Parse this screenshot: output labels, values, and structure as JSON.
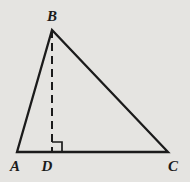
{
  "figure": {
    "background_color": "#e5e4e1",
    "line_color": "#1b1b1b",
    "points": {
      "A": {
        "x": 17,
        "y": 152,
        "label": "A",
        "label_x": 15,
        "label_y": 171
      },
      "B": {
        "x": 52,
        "y": 30,
        "label": "B",
        "label_x": 52,
        "label_y": 21
      },
      "C": {
        "x": 168,
        "y": 152,
        "label": "C",
        "label_x": 173,
        "label_y": 171
      },
      "D": {
        "x": 52,
        "y": 152,
        "label": "D",
        "label_x": 47,
        "label_y": 171
      }
    },
    "triangle_vertices": [
      "A",
      "B",
      "C"
    ],
    "altitude": {
      "from": "B",
      "to": "D",
      "style": "dashed",
      "dash_pattern": "8 5"
    },
    "right_angle_marker": {
      "at": "D",
      "size": 10,
      "side": "right"
    },
    "stroke_widths": {
      "triangle": 2.3,
      "altitude": 2,
      "marker": 1.7
    }
  }
}
